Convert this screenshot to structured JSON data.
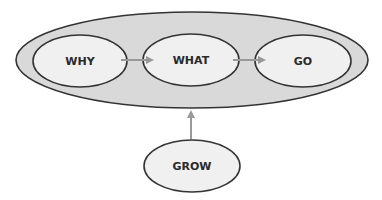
{
  "diagram": {
    "nodes": {
      "why": {
        "label": "WHY"
      },
      "what": {
        "label": "WHAT"
      },
      "go": {
        "label": "GO"
      },
      "grow": {
        "label": "GROW"
      }
    },
    "edges": [
      {
        "from": "WHY",
        "to": "WHAT"
      },
      {
        "from": "WHAT",
        "to": "GO"
      },
      {
        "from": "GROW",
        "to": "container"
      }
    ],
    "colors": {
      "container_fill": "#d9d9d9",
      "node_fill": "#f0f0f0",
      "stroke": "#333333",
      "arrow": "#999999"
    }
  }
}
